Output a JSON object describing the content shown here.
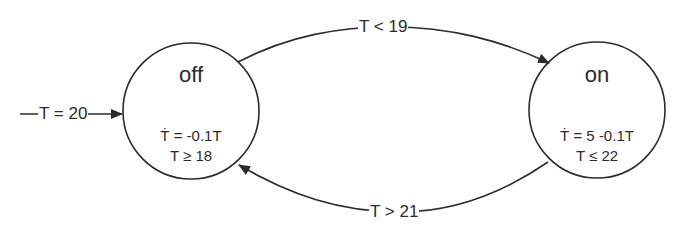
{
  "diagram": {
    "type": "hybrid-automaton",
    "states": [
      {
        "id": "off",
        "name": "off",
        "flow": "Ṫ = -0.1T",
        "invariant": "T ≥ 18"
      },
      {
        "id": "on",
        "name": "on",
        "flow": "Ṫ = 5 -0.1T",
        "invariant": "T ≤  22"
      }
    ],
    "initial": {
      "target": "off",
      "label": "T = 20"
    },
    "transitions": [
      {
        "from": "off",
        "to": "on",
        "label": "T < 19"
      },
      {
        "from": "on",
        "to": "off",
        "label": "T > 21"
      }
    ]
  },
  "colors": {
    "stroke": "#2b2b2b",
    "background": "#ffffff"
  }
}
